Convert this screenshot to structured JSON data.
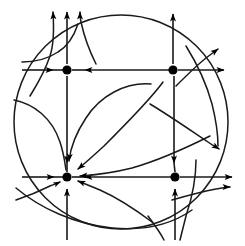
{
  "figure": {
    "title": "Phase portrait with four equilibrium points inside a circular boundary",
    "type": "phase-portrait",
    "width": 245,
    "height": 246,
    "background_color": "#ffffff",
    "stroke_color": "#1a1a1a",
    "dot_color": "#000000"
  },
  "chart_data": {
    "type": "scatter",
    "title": "Phase portrait with four equilibrium points inside a circular boundary",
    "xlabel": "",
    "ylabel": "",
    "xlim": [
      0,
      245
    ],
    "ylim": [
      0,
      246
    ],
    "grid": false,
    "legend": "none",
    "boundary": {
      "shape": "circle",
      "cx": 121,
      "cy": 122,
      "r": 107
    },
    "equilibria": [
      {
        "id": "top-left",
        "x": 67,
        "y": 70,
        "kind": "sink",
        "radius": 4.6
      },
      {
        "id": "top-right",
        "x": 173,
        "y": 70,
        "kind": "saddle",
        "radius": 4.6
      },
      {
        "id": "bottom-left",
        "x": 67,
        "y": 177,
        "kind": "sink",
        "radius": 4.6
      },
      {
        "id": "bottom-right",
        "x": 175,
        "y": 177,
        "kind": "saddle",
        "radius": 4.6
      }
    ],
    "axes": [
      {
        "id": "horizontal-upper",
        "orientation": "horizontal",
        "y": 70,
        "x_from": 22,
        "x_to": 228
      },
      {
        "id": "horizontal-lower",
        "orientation": "horizontal",
        "y": 177,
        "x_from": 22,
        "x_to": 236
      },
      {
        "id": "vertical-left",
        "orientation": "vertical",
        "x": 67,
        "y_from": 8,
        "y_to": 240
      },
      {
        "id": "vertical-right",
        "orientation": "vertical",
        "x": 173,
        "y_from": 20,
        "y_to": 240
      }
    ],
    "flow_direction_notes": [
      "Upper-left equilibrium attracts along the horizontal axis from both sides",
      "Upper-right equilibrium is a saddle: repelling horizontally, attracting vertically",
      "Lower-left equilibrium is a strong sink: all nearby arrows point inward",
      "Lower-right equilibrium is a saddle: repelling horizontally, attracting vertically",
      "Two curved separatrices run from the upper-right saddle to the lower-left sink",
      "Trajectories leave the circular boundary at the top and to the right"
    ],
    "series": [
      {
        "name": "equilibrium-points",
        "x": [
          67,
          173,
          67,
          175
        ],
        "y": [
          70,
          70,
          177,
          177
        ]
      }
    ]
  },
  "arrows": {
    "upward_top": [
      {
        "x": 53,
        "y_tip": 8
      },
      {
        "x": 67,
        "y_tip": 6
      },
      {
        "x": 80,
        "y_tip": 8
      }
    ],
    "count_total": 26
  }
}
